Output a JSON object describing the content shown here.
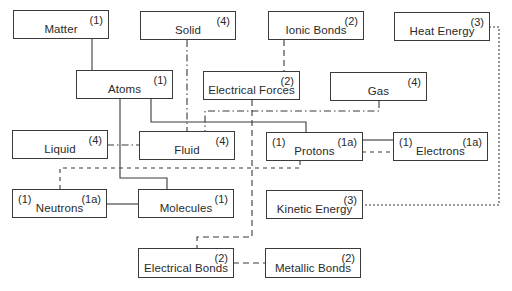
{
  "diagram": {
    "nodes": [
      {
        "id": "matter",
        "label": "Matter",
        "tag_right": "(1)",
        "tag_left": ""
      },
      {
        "id": "solid",
        "label": "Solid",
        "tag_right": "(4)",
        "tag_left": ""
      },
      {
        "id": "ionic-bonds",
        "label": "Ionic Bonds",
        "tag_right": "(2)",
        "tag_left": ""
      },
      {
        "id": "heat-energy",
        "label": "Heat Energy",
        "tag_right": "(3)",
        "tag_left": ""
      },
      {
        "id": "atoms",
        "label": "Atoms",
        "tag_right": "(1)",
        "tag_left": ""
      },
      {
        "id": "electrical-forces",
        "label": "Electrical Forces",
        "tag_right": "(2)",
        "tag_left": ""
      },
      {
        "id": "gas",
        "label": "Gas",
        "tag_right": "(4)",
        "tag_left": ""
      },
      {
        "id": "liquid",
        "label": "Liquid",
        "tag_right": "(4)",
        "tag_left": ""
      },
      {
        "id": "fluid",
        "label": "Fluid",
        "tag_right": "(4)",
        "tag_left": ""
      },
      {
        "id": "protons",
        "label": "Protons",
        "tag_right": "(1a)",
        "tag_left": "(1)"
      },
      {
        "id": "electrons",
        "label": "Electrons",
        "tag_right": "(1a)",
        "tag_left": "(1)"
      },
      {
        "id": "neutrons",
        "label": "Neutrons",
        "tag_right": "(1a)",
        "tag_left": "(1)"
      },
      {
        "id": "molecules",
        "label": "Molecules",
        "tag_right": "(1)",
        "tag_left": ""
      },
      {
        "id": "kinetic-energy",
        "label": "Kinetic Energy",
        "tag_right": "(3)",
        "tag_left": ""
      },
      {
        "id": "electrical-bonds",
        "label": "Electrical Bonds",
        "tag_right": "(2)",
        "tag_left": ""
      },
      {
        "id": "metallic-bonds",
        "label": "Metallic Bonds",
        "tag_right": "(2)",
        "tag_left": ""
      }
    ],
    "edges": [
      {
        "from": "matter",
        "to": "atoms",
        "style": "solid",
        "group": "(1)"
      },
      {
        "from": "atoms",
        "to": "protons",
        "style": "solid",
        "group": "(1)"
      },
      {
        "from": "atoms",
        "to": "molecules",
        "style": "solid",
        "group": "(1)"
      },
      {
        "from": "protons",
        "to": "electrons",
        "style": "solid",
        "group": "(1a)"
      },
      {
        "from": "neutrons",
        "to": "molecules",
        "style": "solid",
        "group": "(1a)"
      },
      {
        "from": "ionic-bonds",
        "to": "electrical-forces",
        "style": "dashed",
        "group": "(2)"
      },
      {
        "from": "electrical-forces",
        "to": "electrical-bonds",
        "style": "dashed",
        "group": "(2)"
      },
      {
        "from": "electrical-bonds",
        "to": "metallic-bonds",
        "style": "dashed",
        "group": "(2)"
      },
      {
        "from": "heat-energy",
        "to": "kinetic-energy",
        "style": "dotted",
        "group": "(3)"
      },
      {
        "from": "solid",
        "to": "fluid",
        "style": "dash-dot",
        "group": "(4)"
      },
      {
        "from": "gas",
        "to": "fluid",
        "style": "dash-dot",
        "group": "(4)"
      },
      {
        "from": "liquid",
        "to": "fluid",
        "style": "dash-dot",
        "group": "(4)"
      },
      {
        "from": "neutrons",
        "to": "protons",
        "style": "short-dash",
        "group": "(1)"
      },
      {
        "from": "protons",
        "to": "electrons",
        "style": "short-dash",
        "group": "(1)"
      }
    ]
  }
}
